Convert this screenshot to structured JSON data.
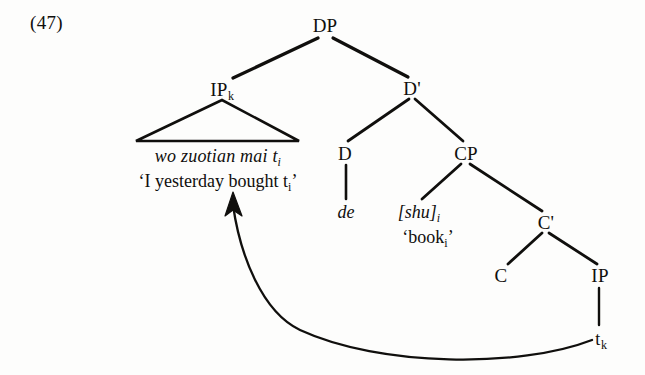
{
  "figure": {
    "example_number": "(47)",
    "type": "syntactic-tree-diagram",
    "ink_color": "#100f0d",
    "background_color": "#fdfdfc"
  },
  "nodes": {
    "dp": "DP",
    "ip_k_label": "IP",
    "ip_k_sub": "k",
    "d_bar": "D'",
    "d": "D",
    "cp": "CP",
    "c_bar": "C'",
    "c": "C",
    "ip": "IP",
    "trace_k_label": "t",
    "trace_k_sub": "k"
  },
  "terminals": {
    "ip_phrase": "wo zuotian mai  t",
    "ip_phrase_sub": "i",
    "ip_gloss_open": "‘I yesterday bought t",
    "ip_gloss_sub": "i",
    "ip_gloss_close": "’",
    "de": "de",
    "shu": "[shu]",
    "shu_sub": "i",
    "shu_gloss_open": "‘book",
    "shu_gloss_sub": "i",
    "shu_gloss_close": "’"
  },
  "annotations": {
    "movement_arrow": "movement arrow from t_k to IP_k"
  }
}
